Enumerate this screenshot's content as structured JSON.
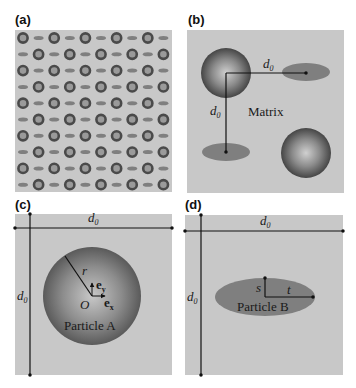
{
  "colors": {
    "background": "#c8c8c8",
    "particle_a_dark": "#4a4a4a",
    "particle_a_light": "#c4c4c4",
    "particle_b": "#7f7f7f",
    "line": "#111111"
  },
  "panels": {
    "a": {
      "label": "(a)",
      "grid_rows": 10,
      "grid_cols": 10,
      "pattern": "alternating particle A and particle B in checkerboard arrangement"
    },
    "b": {
      "label": "(b)",
      "spacing_label": "d",
      "spacing_sub": "0",
      "matrix_label": "Matrix"
    },
    "c": {
      "label": "(c)",
      "spacing_label": "d",
      "spacing_sub": "0",
      "radius_label": "r",
      "origin_label": "O",
      "ey_label": "e",
      "ey_sub": "y",
      "ex_label": "e",
      "ex_sub": "x",
      "particle_label": "Particle A"
    },
    "d": {
      "label": "(d)",
      "spacing_label": "d",
      "spacing_sub": "0",
      "semi_minor_label": "s",
      "semi_major_label": "t",
      "particle_label": "Particle B"
    }
  }
}
